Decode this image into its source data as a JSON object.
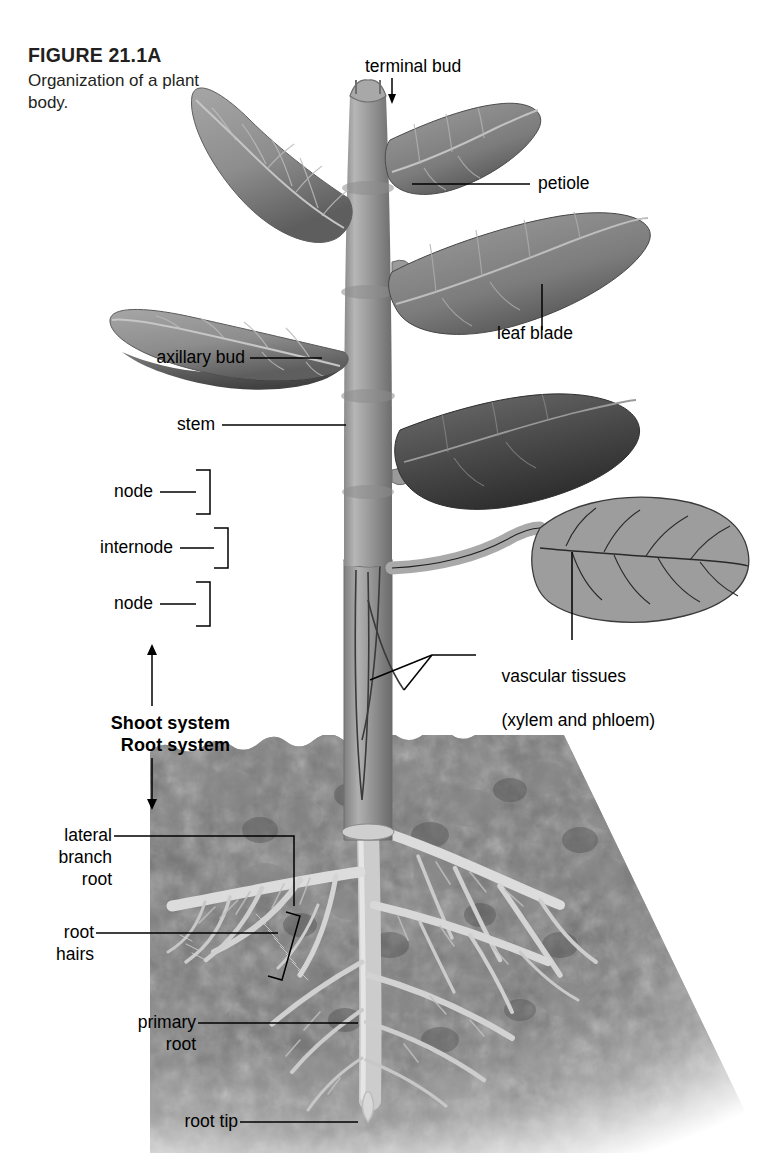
{
  "figure": {
    "number": "FIGURE 21.1A",
    "caption": "Organization of a\nplant body.",
    "style": "grayscale botanical illustration"
  },
  "labels": {
    "terminal_bud": "terminal bud",
    "petiole": "petiole",
    "leaf_blade": "leaf blade",
    "axillary_bud": "axillary bud",
    "stem": "stem",
    "node_upper": "node",
    "internode": "internode",
    "node_lower": "node",
    "vascular_line1": "vascular tissues",
    "vascular_line2": "(xylem and phloem)",
    "shoot_system": "Shoot system",
    "root_system": "Root system",
    "lateral_branch_root": "lateral\nbranch\nroot",
    "root_hairs": "root\nhairs",
    "primary_root": "primary\nroot",
    "root_tip": "root tip"
  },
  "colors": {
    "ink": "#000000",
    "caption_ink": "#231f20",
    "stem": "#9a9a9a",
    "stem_dark": "#6f6f6f",
    "leaf": "#8f8f8f",
    "leaf_dark": "#5a5a5a",
    "leaf_flat": "#9d9d9d",
    "soil": "#6a6a6a",
    "soil_dark": "#4a4a4a",
    "root": "#c9c9c9",
    "background": "#ffffff"
  }
}
